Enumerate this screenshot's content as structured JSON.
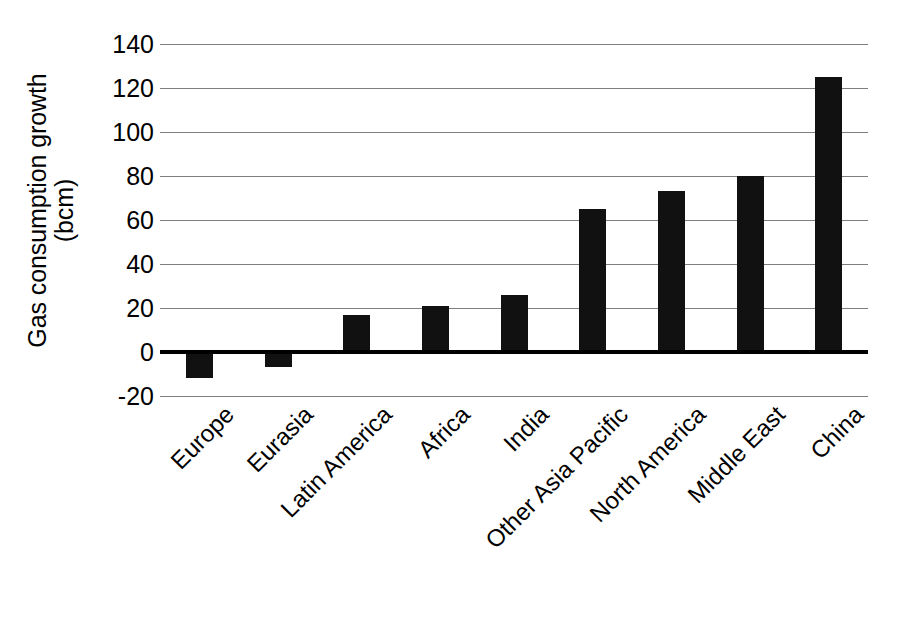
{
  "chart_data": {
    "type": "bar",
    "title": "",
    "xlabel": "",
    "ylabel": "Gas consumption growth (bcm)",
    "ylabel_line1": "Gas consumption growth",
    "ylabel_line2": "(bcm)",
    "units": "bcm",
    "categories": [
      "Europe",
      "Eurasia",
      "Latin America",
      "Africa",
      "India",
      "Other Asia Pacific",
      "North America",
      "Middle East",
      "China"
    ],
    "values": [
      -12,
      -7,
      17,
      21,
      26,
      65,
      73,
      80,
      125
    ],
    "ylim": [
      -20,
      140
    ],
    "yticks": [
      140,
      120,
      100,
      80,
      60,
      40,
      20,
      0,
      -20
    ],
    "ytick_labels": [
      "140",
      "120",
      "100",
      "80",
      "60",
      "40",
      "20",
      "0",
      "-20"
    ],
    "grid": true,
    "legend": false,
    "legend_position": "none",
    "bar_color": "#111111",
    "gridline_color": "#7f7f7f",
    "zeroline_color": "#000000",
    "background_color": "#ffffff",
    "orientation": "vertical",
    "category_label_rotation": -45
  }
}
